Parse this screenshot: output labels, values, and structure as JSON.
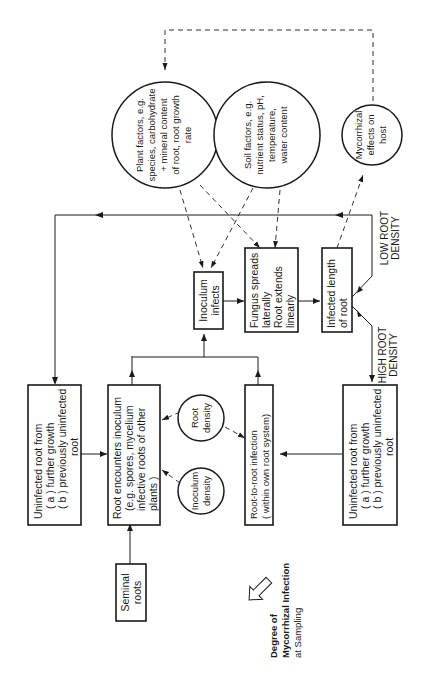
{
  "diagram": {
    "title_lines": [
      "Degree of",
      "Mycorrhizal Infection",
      "at Sampling"
    ],
    "nodes": {
      "seminal_roots": [
        "Seminal",
        "roots"
      ],
      "uninfected_root_top": [
        "Uninfected root from",
        "( a ) further growth",
        "( b ) previously uninfected",
        "root"
      ],
      "root_encounters": [
        "Root encounters inoculum",
        "(e.g. spores, mycelium",
        "infective roots of other",
        "plants )"
      ],
      "root_to_root": [
        "Root-to-root infection",
        "( within own root system)"
      ],
      "inoculum_infects": [
        "Inoculum",
        "infects"
      ],
      "fungus_spreads": [
        "Fungus spreads",
        "laterally",
        "Root extends",
        "linearly"
      ],
      "infected_length": [
        "Infected length",
        "of root"
      ],
      "uninfected_root_bottom": [
        "Uninfected root from",
        "( a ) further growth",
        "( b ) previously uninfected",
        "root"
      ],
      "plant_factors": [
        "Plant factors, e.g.",
        "species, carbohydrate",
        "+ mineral content",
        "of root, root growth",
        "rate"
      ],
      "soil_factors": [
        "Soil factors, e.g.",
        "nutrient status, pH,",
        "temperature,",
        "water content"
      ],
      "mycorrhizal_effects": [
        "Mycorrhizal",
        "effects on",
        "host"
      ],
      "root_density": [
        "Root",
        "density"
      ],
      "inoculum_density": [
        "Inoculum",
        "density"
      ]
    },
    "branch_labels": {
      "low": [
        "LOW ROOT",
        "DENSITY"
      ],
      "high": [
        "HIGH ROOT",
        "DENSITY"
      ]
    }
  }
}
